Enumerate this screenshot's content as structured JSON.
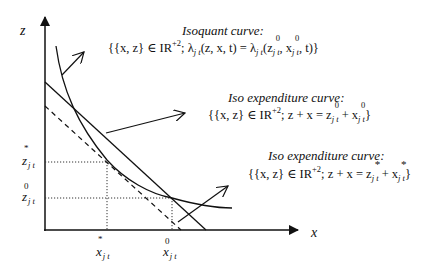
{
  "axes": {
    "x_label": "x",
    "y_label": "z"
  },
  "ticks": {
    "z_star": {
      "var": "z",
      "sub": "j t",
      "mark": "*"
    },
    "z_zero": {
      "var": "z",
      "sub": "j t",
      "mark": "0"
    },
    "x_star": {
      "var": "x",
      "sub": "j t",
      "mark": "*"
    },
    "x_zero": {
      "var": "x",
      "sub": "j t",
      "mark": "0"
    }
  },
  "annotations": {
    "isoquant": {
      "title": "Isoquant curve:",
      "formula_prefix": "{{x, z} ∈ IR",
      "formula_sup": "+2",
      "formula_mid": "; λ",
      "formula_sub1": "j t",
      "formula_args": "(z, x, t) = λ",
      "formula_sub2": "j t",
      "formula_open": "(z",
      "z_mark": "0",
      "z_sub": "j t",
      "comma": ", x",
      "x_mark": "0",
      "x_sub": "j t",
      "formula_close": ", t)}"
    },
    "iso_expenditure_0": {
      "title": "Iso expenditure curve:",
      "formula_prefix": "{{x, z} ∈ IR",
      "formula_sup": "+2",
      "formula_mid": "; z + x = z",
      "z_mark": "0",
      "z_sub": "j t",
      "plus": " + x",
      "x_mark": "0",
      "x_sub": "j t",
      "formula_close": "}"
    },
    "iso_expenditure_star": {
      "title": "Iso expenditure curve:",
      "formula_prefix": "{{x, z} ∈ IR",
      "formula_sup": "+2",
      "formula_mid": "; z + x = z",
      "z_mark": "*",
      "z_sub": "j t",
      "plus": " + x",
      "x_mark": "*",
      "x_sub": "j t",
      "formula_close": "}"
    }
  },
  "geometry": {
    "origin": [
      45,
      230
    ],
    "x_axis_end": [
      300,
      230
    ],
    "y_axis_end": [
      45,
      15
    ],
    "x_star": 107,
    "x_zero": 172,
    "z_star": 162,
    "z_zero": 198,
    "line_color": "#111111"
  }
}
